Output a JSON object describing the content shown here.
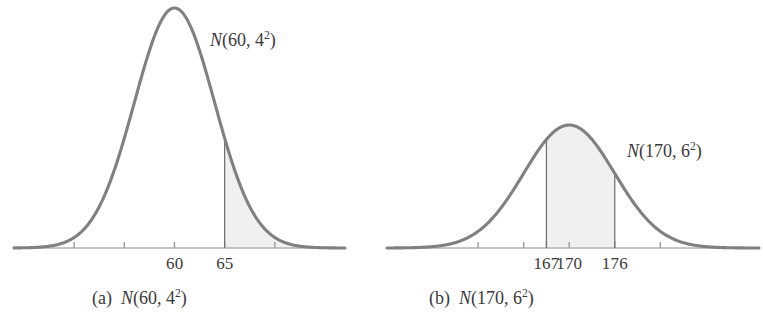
{
  "figure": {
    "type": "two-panel-normal-distribution-figure",
    "background": "#ffffff",
    "curve_color": "#808080",
    "shade_color": "#f0f0f0",
    "axis_color": "#b3b3b3",
    "rule_color": "#737373",
    "text_color": "#3a3a3a"
  },
  "panel_a": {
    "caption_prefix": "(a)",
    "caption_dist_head": "N",
    "caption_dist_body": "(60, 4",
    "caption_dist_exp": "2",
    "caption_dist_tail": ")",
    "annotation_head": "N",
    "annotation_body": "(60, 4",
    "annotation_exp": "2",
    "annotation_tail": ")",
    "tick_labels": [
      "60",
      "65"
    ],
    "tick_values": [
      60,
      65
    ],
    "vline_values": [
      65
    ]
  },
  "panel_b": {
    "caption_prefix": "(b)",
    "caption_dist_head": "N",
    "caption_dist_body": "(170, 6",
    "caption_dist_exp": "2",
    "caption_dist_tail": ")",
    "annotation_head": "N",
    "annotation_body": "(170, 6",
    "annotation_exp": "2",
    "annotation_tail": ")",
    "tick_labels": [
      "167",
      "170",
      "176"
    ],
    "tick_values": [
      167,
      170,
      176
    ],
    "vline_values": [
      167,
      176
    ]
  },
  "chart_data": [
    {
      "type": "line",
      "subtype": "normal-pdf-with-shaded-tail",
      "title": "(a) N(60, 4^2)",
      "annotation": "N(60, 4^2)",
      "distribution": {
        "family": "normal",
        "mu": 60,
        "sigma": 4,
        "variance_label": "4^2"
      },
      "x": [
        44,
        46,
        48,
        50,
        52,
        54,
        56,
        58,
        60,
        62,
        64,
        66,
        68,
        70,
        72,
        74,
        76
      ],
      "y": [
        0.0,
        0.0001,
        0.0009,
        0.0044,
        0.0161,
        0.043,
        0.088,
        0.136,
        0.1587,
        0.136,
        0.088,
        0.043,
        0.0161,
        0.0044,
        0.0009,
        0.0001,
        0.0
      ],
      "ylabel": "density",
      "xlabel": "",
      "xticks": [
        50,
        55,
        60,
        65,
        70
      ],
      "xtick_labels": [
        "",
        "",
        "60",
        "65",
        ""
      ],
      "xlim": [
        44,
        77
      ],
      "grid": false,
      "legend": false,
      "shaded_region": {
        "from": 65,
        "to": "+inf",
        "label": "P(X > 65)",
        "fill": "#f0f0f0"
      },
      "vertical_rules": [
        65
      ]
    },
    {
      "type": "line",
      "subtype": "normal-pdf-with-shaded-interval",
      "title": "(b) N(170, 6^2)",
      "annotation": "N(170, 6^2)",
      "distribution": {
        "family": "normal",
        "mu": 170,
        "sigma": 6,
        "variance_label": "6^2"
      },
      "x": [
        146,
        149,
        152,
        155,
        158,
        161,
        164,
        167,
        170,
        173,
        176,
        179,
        182,
        185,
        188,
        191,
        194
      ],
      "y": [
        0.0,
        0.0001,
        0.0006,
        0.0029,
        0.0108,
        0.0287,
        0.0587,
        0.0907,
        0.1058,
        0.0907,
        0.0587,
        0.0287,
        0.0108,
        0.0029,
        0.0006,
        0.0001,
        0.0
      ],
      "ylabel": "density",
      "xlabel": "",
      "xticks": [
        158,
        164,
        167,
        170,
        176,
        182
      ],
      "xtick_labels": [
        "",
        "",
        "167",
        "170",
        "176",
        ""
      ],
      "xlim": [
        146,
        195
      ],
      "grid": false,
      "legend": false,
      "shaded_region": {
        "from": 167,
        "to": 176,
        "label": "P(167 < X < 176)",
        "fill": "#f0f0f0"
      },
      "vertical_rules": [
        167,
        176
      ]
    }
  ]
}
